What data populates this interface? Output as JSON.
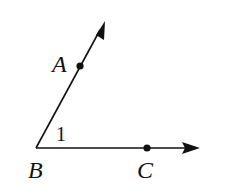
{
  "diagram": {
    "type": "angle",
    "vertex": {
      "label": "B",
      "x": 36,
      "y": 148
    },
    "points": [
      {
        "label": "A",
        "x": 80,
        "y": 66
      },
      {
        "label": "C",
        "x": 147,
        "y": 148
      }
    ],
    "rays": [
      {
        "name": "ray-BA",
        "from": "B",
        "through": "A",
        "end": [
          105,
          21
        ]
      },
      {
        "name": "ray-BC",
        "from": "B",
        "through": "C",
        "end": [
          199,
          148
        ]
      }
    ],
    "angle_label": "1",
    "colors": {
      "stroke": "#111111",
      "background": "#ffffff"
    }
  },
  "labels": {
    "A": "A",
    "B": "B",
    "C": "C",
    "angle": "1"
  }
}
